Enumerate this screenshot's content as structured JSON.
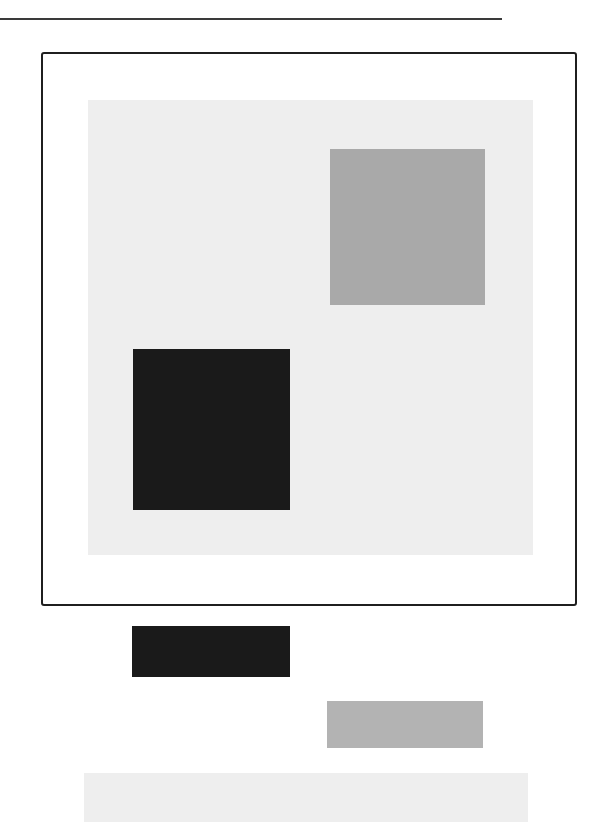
{
  "figure": {
    "type": "color-contrast-illustration",
    "colors": {
      "frame_border": "#1f1f1f",
      "rule": "#3a3a3a",
      "background_panel": "#eeeeee",
      "mid_gray": "#a9a9a9",
      "black": "#1a1a1a",
      "gray_bar": "#b3b3b3",
      "light_bar": "#eeeeee"
    },
    "frame": {
      "panel": {
        "x": 88,
        "y": 100,
        "w": 445,
        "h": 455,
        "color": "#eeeeee"
      },
      "squares": [
        {
          "name": "gray-square",
          "x": 330,
          "y": 149,
          "w": 155,
          "h": 156,
          "color": "#a9a9a9"
        },
        {
          "name": "black-square",
          "x": 133,
          "y": 349,
          "w": 157,
          "h": 161,
          "color": "#1a1a1a"
        }
      ]
    },
    "bars": [
      {
        "name": "black-bar",
        "x": 132,
        "y": 626,
        "w": 158,
        "h": 51,
        "color": "#1a1a1a"
      },
      {
        "name": "gray-bar",
        "x": 327,
        "y": 701,
        "w": 156,
        "h": 47,
        "color": "#b3b3b3"
      },
      {
        "name": "light-bar",
        "x": 84,
        "y": 773,
        "w": 444,
        "h": 49,
        "color": "#eeeeee"
      }
    ]
  }
}
